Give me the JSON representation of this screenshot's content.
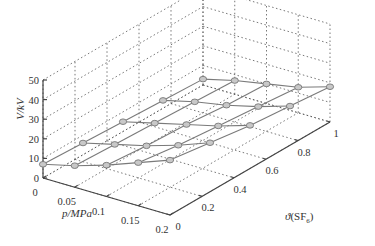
{
  "chart_data": {
    "type": "surface3d",
    "title": "",
    "xlabel": "p/MPa",
    "ylabel": "θ(SF6)",
    "zlabel": "V/kV",
    "x_ticks": [
      "0",
      "0.05",
      "0.1",
      "0.15",
      "0.2"
    ],
    "y_ticks": [
      "0",
      "0.2",
      "0.4",
      "0.6",
      "0.8",
      "1"
    ],
    "z_ticks": [
      "0",
      "10",
      "20",
      "30",
      "40",
      "50"
    ],
    "xlim": [
      0,
      0.2
    ],
    "ylim": [
      0,
      1
    ],
    "zlim": [
      0,
      50
    ],
    "grid": true,
    "x": [
      0.0,
      0.05,
      0.1,
      0.15,
      0.2
    ],
    "y": [
      0.0,
      0.25,
      0.5,
      0.75,
      1.0
    ],
    "z": [
      [
        7,
        11,
        16,
        22,
        28
      ],
      [
        6,
        10,
        14,
        19,
        25
      ],
      [
        5,
        9,
        13,
        17,
        22
      ],
      [
        4,
        8,
        11,
        15,
        20
      ],
      [
        3,
        7,
        10,
        13,
        18
      ]
    ],
    "marker": "circle",
    "line_color": "#7a7a7a",
    "marker_color": "#9a9a9a"
  },
  "labels": {
    "z_axis": "V/kV",
    "x_axis": "p/MPa",
    "y_axis_prefix": "θ(SF",
    "y_axis_sub": "6",
    "y_axis_suffix": ")"
  }
}
